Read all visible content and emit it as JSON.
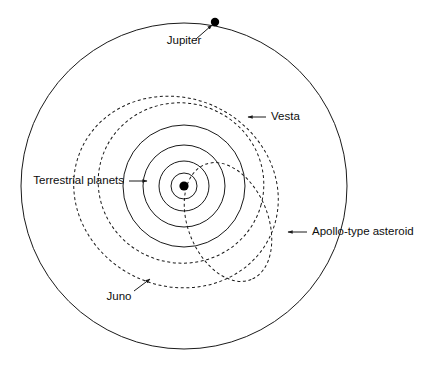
{
  "figure": {
    "kind": "orbit-diagram",
    "background_color": "#ffffff",
    "line_color": "#1a1a1a",
    "center": {
      "x": 184,
      "y": 186
    }
  },
  "chart_data": {
    "type": "scatter",
    "title": "",
    "xlabel": "",
    "ylabel": "",
    "grid": false,
    "legend": "none",
    "orbits": [
      {
        "name": "Jupiter",
        "style": "solid",
        "shape": "circle",
        "center_x": 184,
        "center_y": 186,
        "radius_x": 163,
        "radius_y": 163,
        "rotation": 0
      },
      {
        "name": "Terrestrial planet 4",
        "style": "solid",
        "shape": "circle",
        "center_x": 184,
        "center_y": 186,
        "radius_x": 61,
        "radius_y": 61,
        "rotation": 0
      },
      {
        "name": "Terrestrial planet 3",
        "style": "solid",
        "shape": "circle",
        "center_x": 184,
        "center_y": 186,
        "radius_x": 41,
        "radius_y": 41,
        "rotation": 0
      },
      {
        "name": "Terrestrial planet 2",
        "style": "solid",
        "shape": "circle",
        "center_x": 184,
        "center_y": 186,
        "radius_x": 25,
        "radius_y": 25,
        "rotation": 0
      },
      {
        "name": "Terrestrial planet 1",
        "style": "solid",
        "shape": "circle",
        "center_x": 184,
        "center_y": 186,
        "radius_x": 13,
        "radius_y": 13,
        "rotation": 0
      },
      {
        "name": "Vesta",
        "style": "dashed",
        "shape": "ellipse",
        "center_x": 181,
        "center_y": 183,
        "radius_x": 83,
        "radius_y": 80,
        "rotation": 15
      },
      {
        "name": "Juno",
        "style": "dashed",
        "shape": "ellipse",
        "center_x": 176,
        "center_y": 192,
        "radius_x": 104,
        "radius_y": 94,
        "rotation": 25
      },
      {
        "name": "Apollo-type asteroid",
        "style": "dashed",
        "shape": "ellipse",
        "center_x": 228,
        "center_y": 222,
        "radius_x": 62,
        "radius_y": 40,
        "rotation": 68
      }
    ],
    "points": [
      {
        "name": "Sun",
        "x": 184,
        "y": 186,
        "marker": "filled-circle",
        "size": 4.6,
        "labelled": false
      },
      {
        "name": "Jupiter",
        "x": 215,
        "y": 22,
        "marker": "filled-circle",
        "size": 4.2,
        "labelled": true
      }
    ],
    "annotations": [
      {
        "id": "jupiter",
        "text": "Jupiter",
        "text_x": 184,
        "text_y": 41,
        "align": "middle",
        "arrow_from_x": 196,
        "arrow_from_y": 39,
        "arrow_to_x": 212,
        "arrow_to_y": 25
      },
      {
        "id": "vesta",
        "text": "Vesta",
        "text_x": 271,
        "text_y": 117,
        "align": "start",
        "arrow_from_x": 266,
        "arrow_from_y": 117,
        "arrow_to_x": 248,
        "arrow_to_y": 117
      },
      {
        "id": "terrestrial-planets",
        "text": "Terrestrial planets",
        "text_x": 124,
        "text_y": 181,
        "align": "end",
        "arrow_from_x": 129,
        "arrow_from_y": 181,
        "arrow_to_x": 147,
        "arrow_to_y": 181
      },
      {
        "id": "apollo-type-asteroid",
        "text": "Apollo-type asteroid",
        "text_x": 312,
        "text_y": 232,
        "align": "start",
        "arrow_from_x": 307,
        "arrow_from_y": 232,
        "arrow_to_x": 288,
        "arrow_to_y": 232
      },
      {
        "id": "juno",
        "text": "Juno",
        "text_x": 119,
        "text_y": 297,
        "align": "middle",
        "arrow_from_x": 134,
        "arrow_from_y": 291,
        "arrow_to_x": 150,
        "arrow_to_y": 279
      }
    ]
  },
  "labels": {
    "jupiter": "Jupiter",
    "vesta": "Vesta",
    "terrestrial_planets": "Terrestrial planets",
    "apollo_type_asteroid": "Apollo-type asteroid",
    "juno": "Juno"
  }
}
